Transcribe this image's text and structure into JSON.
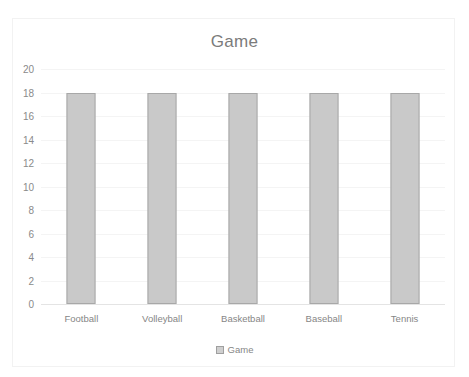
{
  "chart_data": {
    "type": "bar",
    "title": "Game",
    "xlabel": "",
    "ylabel": "",
    "categories": [
      "Football",
      "Volleyball",
      "Basketball",
      "Baseball",
      "Tennis"
    ],
    "values": [
      18,
      18,
      18,
      18,
      18
    ],
    "series": [
      {
        "name": "Game",
        "values": [
          18,
          18,
          18,
          18,
          18
        ]
      }
    ],
    "ylim": [
      0,
      20
    ],
    "ytick_step": 2,
    "yticks": [
      20,
      18,
      16,
      14,
      12,
      10,
      8,
      6,
      4,
      2,
      0
    ],
    "grid": true,
    "legend": [
      "Game"
    ],
    "legend_position": "bottom"
  },
  "style": {
    "bar_fill": "#c9c9c9",
    "bar_border": "#a8a8a8",
    "text_color": "#868686",
    "title_color": "#7b7b7b",
    "gridline_color": "#f4f4f4",
    "frame_color": "#f2f2f2",
    "background": "#ffffff"
  }
}
